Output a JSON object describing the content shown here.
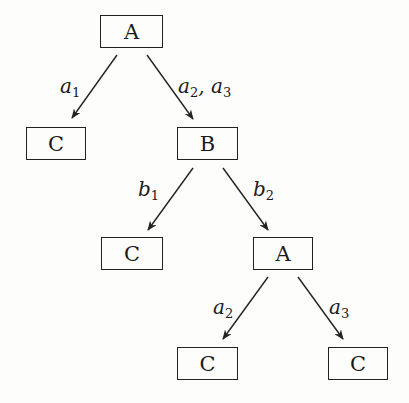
{
  "diagram": {
    "type": "game-tree",
    "nodes": [
      {
        "id": "n0",
        "label": "A"
      },
      {
        "id": "n1",
        "label": "C"
      },
      {
        "id": "n2",
        "label": "B"
      },
      {
        "id": "n3",
        "label": "C"
      },
      {
        "id": "n4",
        "label": "A"
      },
      {
        "id": "n5",
        "label": "C"
      },
      {
        "id": "n6",
        "label": "C"
      }
    ],
    "edges": [
      {
        "from": "n0",
        "to": "n1",
        "label_var": "a",
        "label_sub": "1",
        "label_text": "a1"
      },
      {
        "from": "n0",
        "to": "n2",
        "label_var": "a",
        "label_sub": "2",
        "label_sep": ", ",
        "label_var2": "a",
        "label_sub2": "3",
        "label_text": "a2, a3"
      },
      {
        "from": "n2",
        "to": "n3",
        "label_var": "b",
        "label_sub": "1",
        "label_text": "b1"
      },
      {
        "from": "n2",
        "to": "n4",
        "label_var": "b",
        "label_sub": "2",
        "label_text": "b2"
      },
      {
        "from": "n4",
        "to": "n5",
        "label_var": "a",
        "label_sub": "2",
        "label_text": "a2"
      },
      {
        "from": "n4",
        "to": "n6",
        "label_var": "a",
        "label_sub": "3",
        "label_text": "a3"
      }
    ]
  }
}
